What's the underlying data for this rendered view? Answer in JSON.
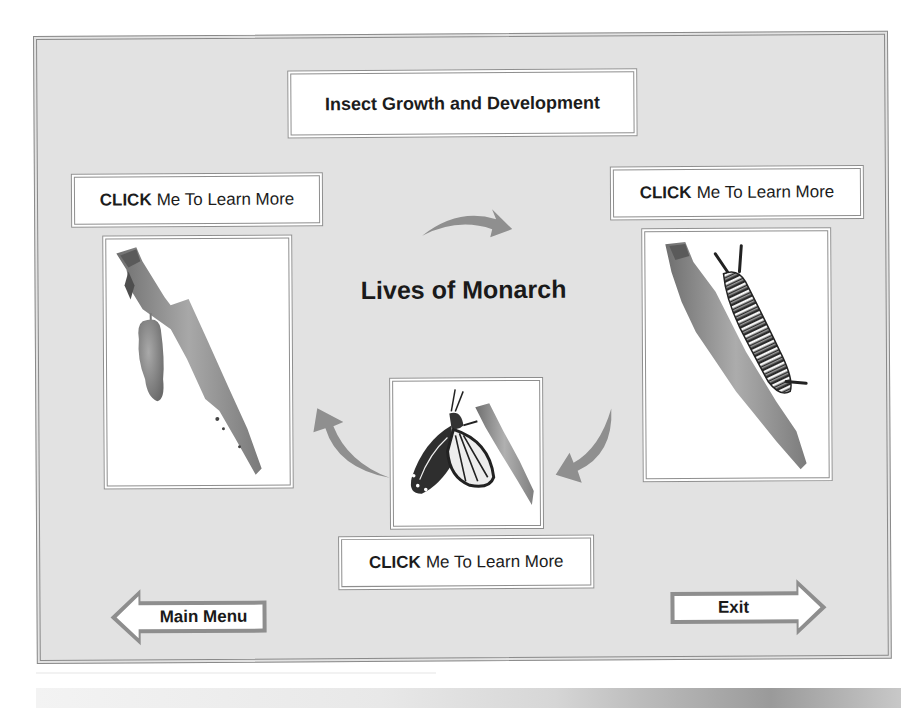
{
  "header": {
    "title": "Insect Growth and Development"
  },
  "main": {
    "heading": "Lives of Monarch",
    "stages": [
      {
        "id": "chrysalis",
        "image_label": "Monarch chrysalis hanging from branch",
        "button": {
          "bold": "CLICK",
          "rest": "Me To Learn More"
        }
      },
      {
        "id": "caterpillar",
        "image_label": "Monarch caterpillar on branch",
        "button": {
          "bold": "CLICK",
          "rest": "Me To Learn More"
        }
      },
      {
        "id": "butterfly",
        "image_label": "Monarch butterfly emerging on branch",
        "button": {
          "bold": "CLICK",
          "rest": "Me To Learn More"
        }
      }
    ],
    "cycle_arrows": [
      "top-curved-arrow-right",
      "right-curved-arrow-down-left",
      "left-curved-arrow-up"
    ]
  },
  "navigation": {
    "back": {
      "label": "Main Menu",
      "icon": "left-arrow-icon"
    },
    "exit": {
      "label": "Exit",
      "icon": "right-arrow-icon"
    }
  },
  "colors": {
    "panel_bg": "#e2e2e2",
    "border": "#8e8e8e",
    "box_bg": "#ffffff",
    "arrow": "#8f8f8f",
    "text": "#1a1a1a"
  }
}
